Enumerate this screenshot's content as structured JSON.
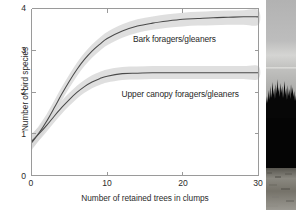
{
  "figure": {
    "panels": [
      "bird-species-response-chart",
      "forest-clump-photograph"
    ]
  },
  "photo": {
    "name": "forest-treeline-photograph",
    "description": "Retained tree clump silhouette against overcast sky",
    "sky_color": "#b9b9b9",
    "tree_color": "#070707",
    "ground_color": "#8e8c88"
  },
  "chart_data": {
    "type": "line",
    "title": "",
    "xlabel": "Number of retained trees in clumps",
    "ylabel": "Number of bird species",
    "xlim": [
      0,
      30
    ],
    "ylim": [
      0,
      4
    ],
    "xticks": [
      "0",
      "10",
      "20",
      "30"
    ],
    "xtick_values": [
      0,
      10,
      20,
      30
    ],
    "yticks": [
      "0",
      "1",
      "2",
      "3",
      "4"
    ],
    "ytick_values": [
      0,
      1,
      2,
      3,
      4
    ],
    "grid": false,
    "legend": "inline-labels",
    "line_color": "#4a4a4a",
    "band_color": "#d6d6d6",
    "x": [
      0,
      1,
      2,
      3,
      4,
      5,
      6,
      7,
      8,
      9,
      10,
      12,
      14,
      16,
      18,
      20,
      22,
      24,
      26,
      28,
      30
    ],
    "series": [
      {
        "name": "Bark foragers/gleaners",
        "label": "Bark foragers/gleaners",
        "values": [
          0.78,
          1.02,
          1.3,
          1.62,
          1.95,
          2.26,
          2.54,
          2.78,
          2.98,
          3.14,
          3.28,
          3.46,
          3.58,
          3.65,
          3.7,
          3.74,
          3.76,
          3.78,
          3.79,
          3.8,
          3.8
        ],
        "band_lower": [
          0.6,
          0.85,
          1.14,
          1.46,
          1.79,
          2.1,
          2.38,
          2.62,
          2.82,
          2.98,
          3.12,
          3.3,
          3.42,
          3.49,
          3.54,
          3.57,
          3.59,
          3.6,
          3.61,
          3.61,
          3.61
        ],
        "band_upper": [
          0.96,
          1.2,
          1.47,
          1.79,
          2.12,
          2.42,
          2.7,
          2.94,
          3.14,
          3.3,
          3.44,
          3.62,
          3.74,
          3.81,
          3.86,
          3.9,
          3.92,
          3.94,
          3.95,
          3.96,
          3.96
        ],
        "label_x": 13.4,
        "label_y": 3.28
      },
      {
        "name": "Upper canopy foragers/gleaners",
        "label": "Upper canopy foragers/gleaners",
        "values": [
          0.82,
          1.0,
          1.2,
          1.42,
          1.63,
          1.82,
          1.99,
          2.13,
          2.24,
          2.32,
          2.38,
          2.44,
          2.45,
          2.46,
          2.46,
          2.46,
          2.46,
          2.46,
          2.46,
          2.46,
          2.46
        ],
        "band_lower": [
          0.64,
          0.84,
          1.05,
          1.27,
          1.48,
          1.67,
          1.84,
          1.98,
          2.09,
          2.17,
          2.23,
          2.29,
          2.3,
          2.31,
          2.31,
          2.31,
          2.31,
          2.31,
          2.31,
          2.31,
          2.31
        ],
        "band_upper": [
          1.0,
          1.17,
          1.36,
          1.58,
          1.79,
          1.98,
          2.15,
          2.29,
          2.4,
          2.48,
          2.54,
          2.6,
          2.61,
          2.62,
          2.62,
          2.62,
          2.62,
          2.62,
          2.62,
          2.62,
          2.62
        ],
        "label_x": 11.9,
        "label_y": 1.95
      }
    ]
  }
}
